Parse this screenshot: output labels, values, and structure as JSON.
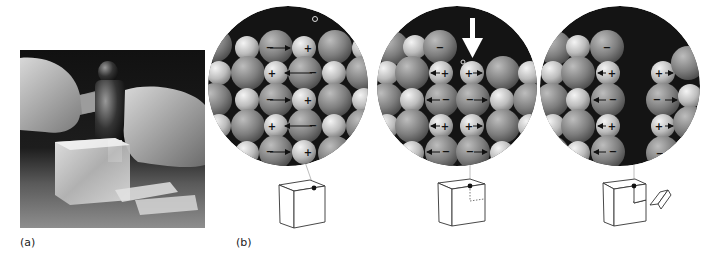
{
  "figure": {
    "panel_a_label": "(a)",
    "panel_b_label": "(b)",
    "photo": {
      "description": "hands striking a clear ionic crystal block with a hammer and chisel; cleaved fragments lie in front",
      "background_color": "#1a1a1a"
    },
    "stages": [
      {
        "id": "intact",
        "description": "ordered lattice; opposite charges attract along each row",
        "rows": [
          [
            "large",
            "small",
            "large",
            "small+",
            "large",
            "small"
          ],
          [
            "small",
            "large",
            "small+",
            "large-",
            "small",
            "large"
          ],
          [
            "large",
            "small",
            "large-",
            "small+",
            "large",
            "small"
          ],
          [
            "small",
            "large",
            "small+",
            "large-",
            "small",
            "large"
          ],
          [
            "large",
            "small",
            "large-",
            "small+",
            "large",
            "small"
          ]
        ],
        "bond_type": "attraction",
        "cube": "intact"
      },
      {
        "id": "stressed",
        "description": "force applied shifts layer so like charges align and repel",
        "arrow": "down",
        "bond_type": "repulsion",
        "cube": "dotted-cleavage"
      },
      {
        "id": "cleaved",
        "description": "repulsion splits crystal along a plane",
        "bond_type": "separated",
        "cube": "fragment-removed"
      }
    ],
    "ion_signs": {
      "anion": "−",
      "cation": "+"
    },
    "colors": {
      "anion": "#8a8a8a",
      "cation": "#c8c8c8",
      "background": "#141414",
      "lead_line": "#bdbdbd",
      "cube_stroke": "#333333"
    }
  }
}
